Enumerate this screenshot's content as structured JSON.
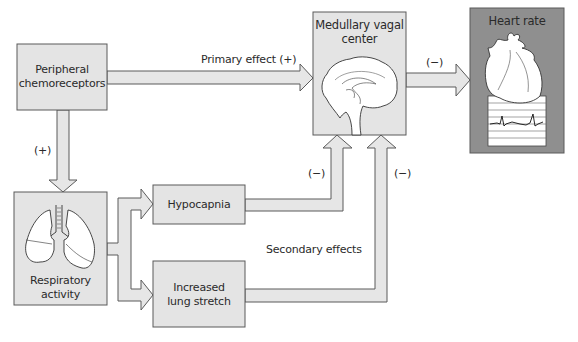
{
  "diagram": {
    "nodes": {
      "peripheral": {
        "label_line1": "Peripheral",
        "label_line2": "chemoreceptors"
      },
      "medullary": {
        "label_line1": "Medullary vagal",
        "label_line2": "center",
        "icon": "brain-icon"
      },
      "heart": {
        "label": "Heart rate",
        "icon": "heart-icon"
      },
      "respiratory": {
        "label_line1": "Respiratory",
        "label_line2": "activity",
        "icon": "lungs-icon"
      },
      "hypocapnia": {
        "label": "Hypocapnia"
      },
      "lung_stretch": {
        "label_line1": "Increased",
        "label_line2": "lung stretch"
      }
    },
    "edges": {
      "primary": {
        "from": "peripheral",
        "to": "medullary",
        "label": "Primary effect (+)"
      },
      "medullary_to_heart": {
        "from": "medullary",
        "to": "heart",
        "label": "(−)"
      },
      "peripheral_to_respiratory": {
        "from": "peripheral",
        "to": "respiratory",
        "label": "(+)"
      },
      "respiratory_to_hypocapnia": {
        "from": "respiratory",
        "to": "hypocapnia"
      },
      "respiratory_to_lung_stretch": {
        "from": "respiratory",
        "to": "lung_stretch"
      },
      "hypocapnia_to_medullary": {
        "from": "hypocapnia",
        "to": "medullary",
        "label": "(−)"
      },
      "lung_stretch_to_medullary": {
        "from": "lung_stretch",
        "to": "medullary",
        "label": "(−)"
      }
    },
    "annotations": {
      "secondary": "Secondary effects"
    },
    "colors": {
      "box_fill": "#e4e4e4",
      "heart_box_fill": "#8f8f8f",
      "arrow_fill": "#e6e6e6",
      "stroke": "#555555"
    }
  }
}
